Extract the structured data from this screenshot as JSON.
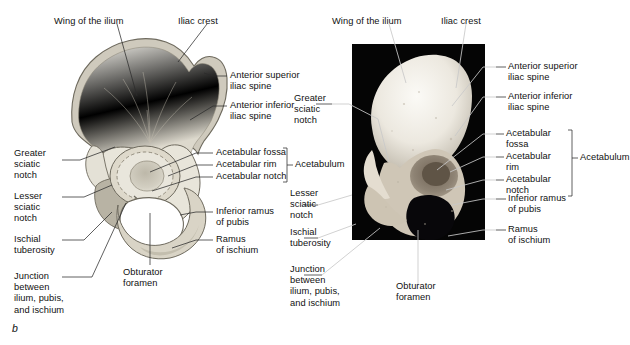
{
  "figure": {
    "panel_letter": "b",
    "title_absent": true,
    "panels": [
      {
        "name": "illustration",
        "type": "line-drawing",
        "subject": "right hip bone, lateral view"
      },
      {
        "name": "photograph",
        "type": "photo",
        "subject": "right hip bone, lateral view",
        "background_color": "#050505"
      }
    ]
  },
  "colors": {
    "bone_fill": "#efede4",
    "bone_shadow": "#d6d2c6",
    "bone_outline": "#6e6a5e",
    "photo_background": "#050505",
    "leader_dark": "#2b2b2b",
    "leader_light": "#c9c9c9",
    "text": "#111111",
    "page_background": "#ffffff"
  },
  "illustration_labels": {
    "wing_of_ilium": "Wing of the ilium",
    "iliac_crest": "Iliac crest",
    "anterior_superior_iliac_spine": "Anterior superior\niliac spine",
    "anterior_inferior_iliac_spine": "Anterior inferior\niliac spine",
    "acetabular_fossa": "Acetabular fossa",
    "acetabular_rim": "Acetabular rim",
    "acetabular_notch": "Acetabular notch",
    "acetabulum": "Acetabulum",
    "greater_sciatic_notch": "Greater\nsciatic\nnotch",
    "lesser_sciatic_notch": "Lesser\nsciatic\nnotch",
    "ischial_tuberosity": "Ischial\ntuberosity",
    "junction": "Junction\nbetween\nilium, pubis,\nand ischium",
    "obturator_foramen": "Obturator\nforamen",
    "inferior_ramus_of_pubis": "Inferior ramus\nof pubis",
    "ramus_of_ischium": "Ramus\nof ischium"
  },
  "photo_labels": {
    "wing_of_ilium": "Wing of the ilium",
    "iliac_crest": "Iliac crest",
    "anterior_superior_iliac_spine": "Anterior superior\niliac spine",
    "anterior_inferior_iliac_spine": "Anterior inferior\niliac spine",
    "acetabular_fossa": "Acetabular\nfossa",
    "acetabular_rim": "Acetabular\nrim",
    "acetabular_notch": "Acetabular\nnotch",
    "acetabulum": "Acetabulum",
    "greater_sciatic_notch": "Greater\nsciatic\nnotch",
    "lesser_sciatic_notch": "Lesser\nsciatic\nnotch",
    "ischial_tuberosity": "Ischial\ntuberosity",
    "junction": "Junction\nbetween\nilium, pubis,\nand ischium",
    "obturator_foramen": "Obturator\nforamen",
    "inferior_ramus_of_pubis": "Inferior ramus\nof pubis",
    "ramus_of_ischium": "Ramus\nof ischium"
  }
}
